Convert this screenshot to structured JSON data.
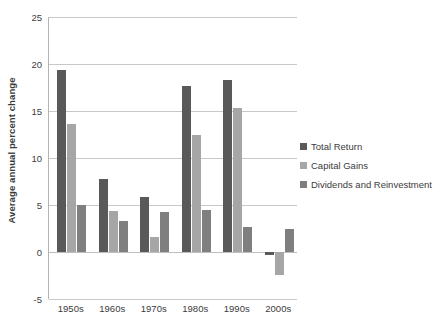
{
  "chart_data": {
    "type": "bar",
    "title": "",
    "subtitle": "",
    "xlabel": "",
    "ylabel": "Average annual percent change",
    "categories": [
      "1950s",
      "1960s",
      "1970s",
      "1980s",
      "1990s",
      "2000s"
    ],
    "series": [
      {
        "name": "Total Return",
        "color": "#595959",
        "values": [
          19.4,
          7.8,
          5.9,
          17.7,
          18.3,
          -0.3
        ]
      },
      {
        "name": "Capital Gains",
        "color": "#a6a6a6",
        "values": [
          13.6,
          4.4,
          1.6,
          12.4,
          15.3,
          -2.4
        ]
      },
      {
        "name": "Dividends and Reinvestment",
        "color": "#7f7f7f",
        "values": [
          5.0,
          3.3,
          4.3,
          4.5,
          2.7,
          2.4
        ]
      }
    ],
    "ylim": [
      -5,
      25
    ],
    "yticks": [
      -5,
      0,
      5,
      10,
      15,
      20,
      25
    ],
    "ytick_labels": [
      "-5",
      "0",
      "5",
      "10",
      "15",
      "20",
      "25"
    ],
    "grid": true,
    "grid_axis": "y",
    "legend_position": "right",
    "legend": [
      "Total Return",
      "Capital Gains",
      "Dividends and Reinvestment"
    ],
    "background": "#ffffff",
    "gridline_color": "#c8c8c8",
    "axis_color": "#b4b4b4"
  }
}
